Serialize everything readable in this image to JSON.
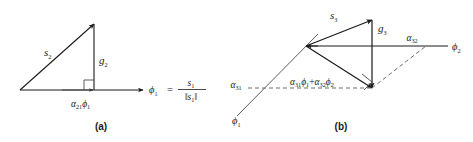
{
  "figure": {
    "background_color": "#ffffff",
    "ink_color": "#1a1a1a",
    "dash_color": "#6b6b6b",
    "panels": [
      {
        "id": "a",
        "caption": "(a)",
        "labels": {
          "hypotenuse": "s",
          "hypotenuse_sub": "2",
          "vertical": "g",
          "vertical_sub": "2",
          "baseline": "α",
          "baseline_sub": "21",
          "baseline_phi": "ϕ",
          "baseline_phi_sub": "1",
          "axis_phi": "ϕ",
          "axis_phi_sub": "1",
          "axis_equals": "=",
          "frac_num": "s",
          "frac_num_sub": "1",
          "frac_den_open": "‖",
          "frac_den_s": "s",
          "frac_den_sub": "1",
          "frac_den_close": "‖"
        }
      },
      {
        "id": "b",
        "caption": "(b)",
        "labels": {
          "hypotenuse": "s",
          "hypotenuse_sub": "3",
          "vertical": "g",
          "vertical_sub": "3",
          "axis_phi1": "ϕ",
          "axis_phi1_sub": "1",
          "axis_phi2": "ϕ",
          "axis_phi2_sub": "2",
          "alpha31": "α",
          "alpha31_sub": "31",
          "alpha32": "α",
          "alpha32_sub": "32",
          "proj_a1": "α",
          "proj_a1_sub": "31",
          "proj_phi1": "ϕ",
          "proj_phi1_sub": "1",
          "proj_plus": "+",
          "proj_a2": "α",
          "proj_a2_sub": "32",
          "proj_phi2": "ϕ",
          "proj_phi2_sub": "2"
        }
      }
    ]
  }
}
